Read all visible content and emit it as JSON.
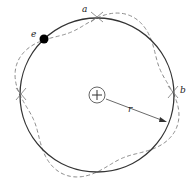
{
  "diagram": {
    "labels": {
      "a": "a",
      "b": "b",
      "e": "e",
      "r": "r",
      "nucleus": "+"
    },
    "geometry": {
      "center": [
        97,
        95
      ],
      "orbit_radius": 77,
      "wave_amplitude": 9,
      "wave_nodes_full_wavelengths": 4,
      "nucleus_radius": 8
    },
    "colors": {
      "orbit": "#333333",
      "wave": "#888888",
      "electron": "#000000"
    }
  }
}
